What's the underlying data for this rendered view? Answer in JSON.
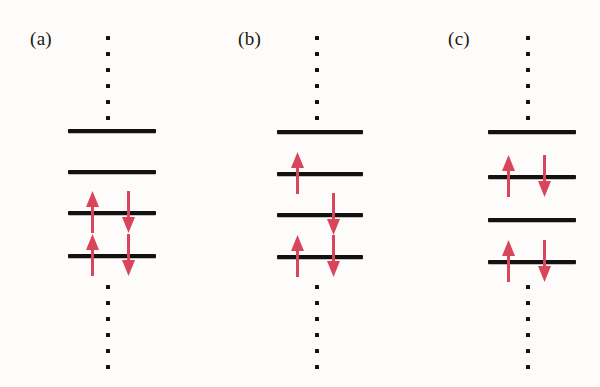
{
  "figure": {
    "background_color": "#fdfcfa",
    "level_color": "#141210",
    "arrow_color": "#d9455a",
    "dot_color": "#14110e",
    "panel_count": 3,
    "levels_per_panel": 4
  },
  "panels": [
    {
      "id": "a",
      "label": "(a)",
      "label_x": 30,
      "label_y": 28,
      "axis_x": 108,
      "line_left": 68,
      "line_width": 88,
      "dots_above": {
        "count": 6,
        "x": 108,
        "y_start": 36,
        "spacing": 16
      },
      "dots_below": {
        "count": 6,
        "x": 108,
        "y_start": 285,
        "spacing": 16
      },
      "levels": [
        {
          "index": 1,
          "y": 129,
          "occupancy": "empty",
          "spins": []
        },
        {
          "index": 2,
          "y": 170,
          "occupancy": "empty",
          "spins": []
        },
        {
          "index": 3,
          "y": 211,
          "occupancy": "paired",
          "spins": [
            "up",
            "down"
          ]
        },
        {
          "index": 4,
          "y": 254,
          "occupancy": "paired",
          "spins": [
            "up",
            "down"
          ]
        }
      ],
      "spin_up_x": 92,
      "spin_down_x": 128
    },
    {
      "id": "b",
      "label": "(b)",
      "label_x": 238,
      "label_y": 28,
      "axis_x": 317,
      "line_left": 277,
      "line_width": 86,
      "dots_above": {
        "count": 6,
        "x": 317,
        "y_start": 36,
        "spacing": 16
      },
      "dots_below": {
        "count": 6,
        "x": 317,
        "y_start": 285,
        "spacing": 16
      },
      "levels": [
        {
          "index": 1,
          "y": 130,
          "occupancy": "empty",
          "spins": []
        },
        {
          "index": 2,
          "y": 172,
          "occupancy": "single-up",
          "spins": [
            "up"
          ]
        },
        {
          "index": 3,
          "y": 213,
          "occupancy": "single-down",
          "spins": [
            "down"
          ]
        },
        {
          "index": 4,
          "y": 255,
          "occupancy": "paired",
          "spins": [
            "up",
            "down"
          ]
        }
      ],
      "spin_up_x": 297,
      "spin_down_x": 333
    },
    {
      "id": "c",
      "label": "(c)",
      "label_x": 448,
      "label_y": 28,
      "axis_x": 528,
      "line_left": 488,
      "line_width": 88,
      "dots_above": {
        "count": 6,
        "x": 528,
        "y_start": 36,
        "spacing": 16
      },
      "dots_below": {
        "count": 6,
        "x": 528,
        "y_start": 285,
        "spacing": 16
      },
      "levels": [
        {
          "index": 1,
          "y": 130,
          "occupancy": "empty",
          "spins": []
        },
        {
          "index": 2,
          "y": 175,
          "occupancy": "paired",
          "spins": [
            "up",
            "down"
          ]
        },
        {
          "index": 3,
          "y": 218,
          "occupancy": "empty",
          "spins": []
        },
        {
          "index": 4,
          "y": 260,
          "occupancy": "paired",
          "spins": [
            "up",
            "down"
          ]
        }
      ],
      "spin_up_x": 508,
      "spin_down_x": 544
    }
  ],
  "geometry": {
    "level_line_height": 4,
    "arrow_length": 42,
    "arrow_head_width": 13,
    "arrow_head_height": 16,
    "arrow_stem_width": 3,
    "arrow_overshoot_above": 22,
    "arrow_overshoot_below": 20
  }
}
